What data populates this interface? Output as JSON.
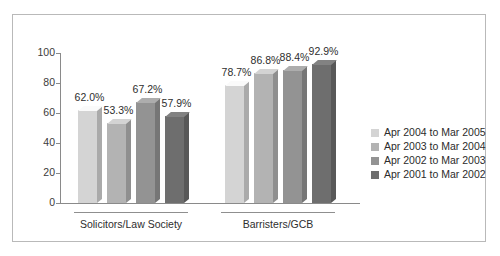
{
  "chart_data": {
    "type": "bar",
    "title": "",
    "subtitle": "",
    "xlabel": "",
    "ylabel": "",
    "ylim": [
      0,
      100
    ],
    "grid": false,
    "legend_position": "right",
    "y_ticks": [
      "0",
      "20",
      "40",
      "60",
      "80",
      "100"
    ],
    "y_tick_values": [
      0,
      20,
      40,
      60,
      80,
      100
    ],
    "categories": [
      "Solicitors/Law Society",
      "Barristers/GCB"
    ],
    "series": [
      {
        "name": "Apr 2004 to Mar 2005",
        "color": "#d4d4d4",
        "values": [
          62.0,
          78.7
        ],
        "labels": [
          "62.0%",
          "78.7%"
        ]
      },
      {
        "name": "Apr 2003 to Mar 2004",
        "color": "#b3b3b3",
        "values": [
          53.3,
          86.8
        ],
        "labels": [
          "53.3%",
          "86.8%"
        ]
      },
      {
        "name": "Apr 2002 to Mar 2003",
        "color": "#939393",
        "values": [
          67.2,
          88.4
        ],
        "labels": [
          "67.2%",
          "88.4%"
        ]
      },
      {
        "name": "Apr 2001 to Mar 2002",
        "color": "#6e6e6e",
        "values": [
          57.9,
          92.9
        ],
        "labels": [
          "57.9%",
          "92.9%"
        ]
      }
    ]
  },
  "frame": {
    "border_color": "#b9b9b9",
    "background": "#ffffff"
  },
  "axis": {
    "line_color": "#8a8a8a"
  }
}
